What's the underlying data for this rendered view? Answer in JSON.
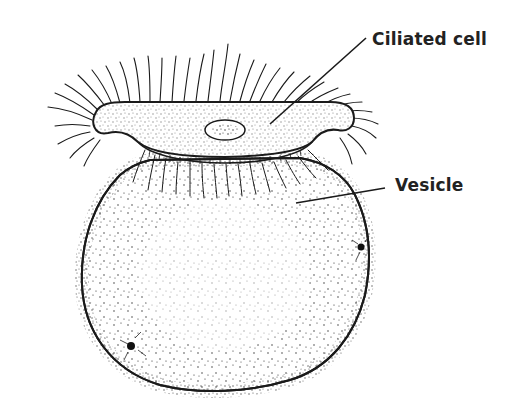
{
  "diagram": {
    "type": "biological-illustration",
    "labels": {
      "ciliated_cell": "Ciliated cell",
      "vesicle": "Vesicle"
    },
    "colors": {
      "ink": "#1a1a1a",
      "label_text": "#222222",
      "background": "#ffffff"
    }
  }
}
